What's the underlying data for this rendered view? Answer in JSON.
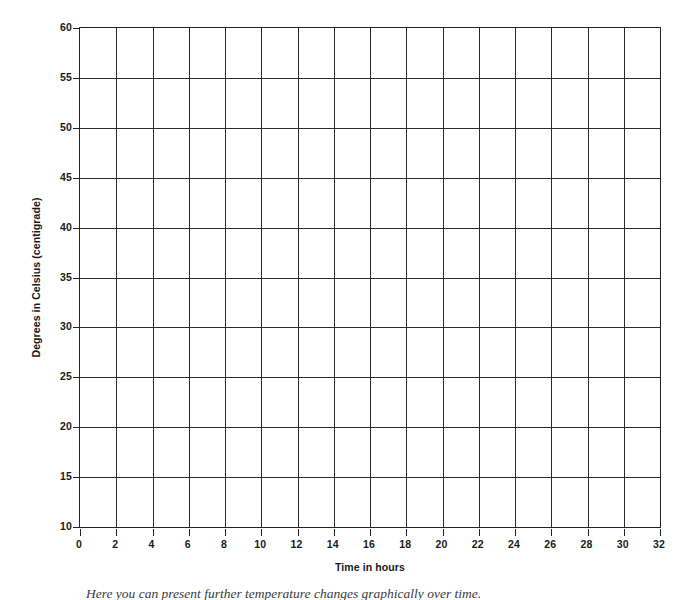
{
  "chart_data": {
    "type": "line",
    "title": "",
    "subtitle": "",
    "xlabel": "Time in hours",
    "ylabel": "Degrees in Celsius (centigrade)",
    "xlim": [
      0,
      32
    ],
    "ylim": [
      10,
      60
    ],
    "x_ticks": [
      0,
      2,
      4,
      6,
      8,
      10,
      12,
      14,
      16,
      18,
      20,
      22,
      24,
      26,
      28,
      30,
      32
    ],
    "y_ticks": [
      10,
      15,
      20,
      25,
      30,
      35,
      40,
      45,
      50,
      55,
      60
    ],
    "x_tick_labels": [
      "0",
      "2",
      "4",
      "6",
      "8",
      "10",
      "12",
      "14",
      "16",
      "18",
      "20",
      "22",
      "24",
      "26",
      "28",
      "30",
      "32"
    ],
    "y_tick_labels": [
      "10",
      "15",
      "20",
      "25",
      "30",
      "35",
      "40",
      "45",
      "50",
      "55",
      "60"
    ],
    "x_tick_step": 2,
    "y_tick_step": 5,
    "grid": true,
    "grid_axes": "both",
    "legend": false,
    "series": [],
    "values": [],
    "categories": [],
    "annotations": []
  },
  "figure": {
    "caption": "Here you can present further temperature changes graphically over time.",
    "background_color": "#ffffff",
    "line_color": "#2b2b2b",
    "frame_color": "#232323",
    "text_color": "#1a1a1a"
  }
}
